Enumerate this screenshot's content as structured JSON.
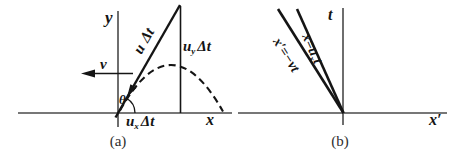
{
  "figure": {
    "background_color": "#ffffff",
    "line_color": "#151515",
    "axis_color": "#4a4a4a",
    "caption_color": "#2e2e2e"
  },
  "panel_a": {
    "caption": "(a)",
    "y_axis_label": "y",
    "x_axis_label": "x",
    "v_label": "v",
    "theta_label": "θ",
    "u_dt_label": {
      "base": "u",
      "rest": "Δt"
    },
    "uy_dt_label": {
      "base": "u",
      "sub": "y",
      "rest": "Δt"
    },
    "ux_dt_label": {
      "base": "u",
      "sub": "x",
      "rest": "Δt"
    }
  },
  "panel_b": {
    "caption": "(b)",
    "t_axis_label": "t",
    "x_axis_label": "x′",
    "inner_line_label": {
      "lead": "x=u",
      "sub": "x",
      "tail": "t"
    },
    "outer_line_label": "x′=−vt"
  }
}
